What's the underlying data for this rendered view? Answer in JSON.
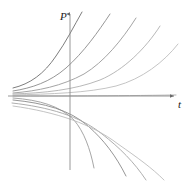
{
  "figure": {
    "background_color": "#ffffff",
    "type": "differential-equation-solution-family"
  },
  "axes": {
    "vertical": {
      "label": "P",
      "name": "p-axis",
      "x": 70,
      "y_top": 12,
      "y_bottom": 170,
      "arrow": "up",
      "color": "#8c8c8c",
      "label_x": 60,
      "label_y": 20
    },
    "horizontal": {
      "label": "t",
      "name": "t-axis",
      "y": 96,
      "x_left": 8,
      "x_right": 176,
      "arrow": "right",
      "color": "#8c8c8c",
      "label_x": 178,
      "label_y": 108
    }
  },
  "chart_data": {
    "type": "line",
    "title": "",
    "xlabel": "t",
    "ylabel": "P",
    "xlim": [
      0,
      190
    ],
    "ylim": [
      181,
      0
    ],
    "grid": false,
    "legend": null,
    "series": [
      {
        "name": "curve-up-1",
        "color": "#6e6e6e",
        "width": 0.9,
        "path": "M 13,88 C 30,84 44,74 56,56 C 66,42 74,26 82,12"
      },
      {
        "name": "curve-up-2",
        "color": "#8a8a8a",
        "width": 0.9,
        "path": "M 13,91 C 32,88 50,82 66,68 C 84,52 98,32 110,14"
      },
      {
        "name": "curve-up-3",
        "color": "#9a9a9a",
        "width": 0.9,
        "path": "M 13,93 C 38,91 62,86 84,74 C 104,62 122,40 136,18"
      },
      {
        "name": "curve-up-4",
        "color": "#b0b0b0",
        "width": 0.9,
        "path": "M 13,94 C 44,93 74,90 100,80 C 124,70 146,48 160,26"
      },
      {
        "name": "curve-up-5",
        "color": "#bdbdbd",
        "width": 0.9,
        "path": "M 13,95 C 50,94 88,93 116,86 C 142,79 164,62 178,44"
      },
      {
        "name": "curve-flat",
        "color": "#a8a8a8",
        "width": 0.9,
        "path": "M 13,96 C 60,96 110,96 176,95"
      },
      {
        "name": "curve-down-1",
        "color": "#9c9c9c",
        "width": 0.9,
        "path": "M 13,98 C 40,100 60,106 74,120 C 84,132 90,148 94,168"
      },
      {
        "name": "curve-down-2",
        "color": "#8a8a8a",
        "width": 0.9,
        "path": "M 13,100 C 44,103 70,110 88,126 C 104,140 116,156 126,176"
      },
      {
        "name": "curve-down-3",
        "color": "#a5a5a5",
        "width": 0.9,
        "path": "M 12,103 C 48,107 80,116 102,134 C 120,148 134,162 146,180"
      },
      {
        "name": "curve-down-4",
        "color": "#bcbcbc",
        "width": 0.9,
        "path": "M 13,106 C 56,112 92,124 118,144 C 138,158 152,168 164,180"
      }
    ]
  }
}
